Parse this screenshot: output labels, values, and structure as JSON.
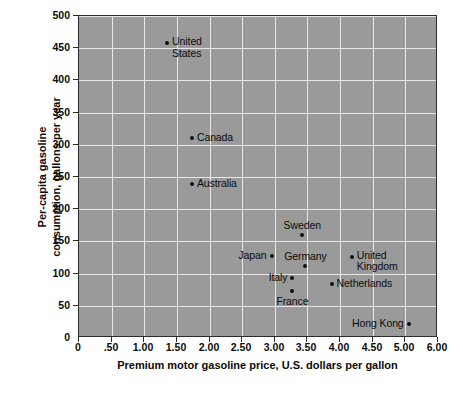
{
  "chart_data": {
    "type": "scatter",
    "title": "",
    "xlabel": "Premium motor gasoline price,\nU.S. dollars per gallon",
    "xlabel_line1": "Premium motor gasoline price,",
    "xlabel_line2": "U.S. dollars per gallon",
    "ylabel": "Per-capita gasoline consumption, gallons per year",
    "ylabel_line1": "Per-capita gasoline",
    "ylabel_line2": "consumption, gallons per year",
    "xlim": [
      0,
      6.0
    ],
    "ylim": [
      0,
      500
    ],
    "xticks": [
      0,
      0.5,
      1.0,
      1.5,
      2.0,
      2.5,
      3.0,
      3.5,
      4.0,
      4.5,
      5.0,
      6.0
    ],
    "xticklabels": [
      "0",
      ".50",
      "1.00",
      "1.50",
      "2.00",
      "2.50",
      "3.00",
      "3.50",
      "4.00",
      "4.50",
      "5.00",
      "6.00"
    ],
    "yticks": [
      0,
      50,
      100,
      150,
      200,
      250,
      300,
      350,
      400,
      450,
      500
    ],
    "yticklabels": [
      "0",
      "50",
      "100",
      "150",
      "200",
      "250",
      "300",
      "350",
      "400",
      "450",
      "500"
    ],
    "grid": true,
    "grid_color": "#e8e8e8",
    "plot_background": "#9a9a9a",
    "marker_color": "#101010",
    "points": [
      {
        "label": "United States",
        "label_line1": "United",
        "label_line2": "States",
        "x": 1.35,
        "y": 458,
        "anchor": "right",
        "multiline": true
      },
      {
        "label": "Canada",
        "x": 1.73,
        "y": 311,
        "anchor": "right",
        "multiline": false
      },
      {
        "label": "Australia",
        "x": 1.73,
        "y": 239,
        "anchor": "right",
        "multiline": false
      },
      {
        "label": "Sweden",
        "x": 3.42,
        "y": 160,
        "anchor": "above",
        "multiline": false
      },
      {
        "label": "Japan",
        "x": 2.95,
        "y": 127,
        "anchor": "left",
        "multiline": false
      },
      {
        "label": "Germany",
        "x": 3.47,
        "y": 112,
        "anchor": "above",
        "multiline": false
      },
      {
        "label": "United Kingdom",
        "label_line1": "United",
        "label_line2": "Kingdom",
        "x": 4.18,
        "y": 126,
        "anchor": "right",
        "multiline": true
      },
      {
        "label": "Italy",
        "x": 3.27,
        "y": 93,
        "anchor": "left",
        "multiline": false
      },
      {
        "label": "France",
        "x": 3.27,
        "y": 73,
        "anchor": "below",
        "multiline": false
      },
      {
        "label": "Netherlands",
        "x": 3.87,
        "y": 84,
        "anchor": "right",
        "multiline": false
      },
      {
        "label": "Hong Kong",
        "x": 5.1,
        "y": 22,
        "anchor": "left",
        "multiline": false
      }
    ]
  }
}
